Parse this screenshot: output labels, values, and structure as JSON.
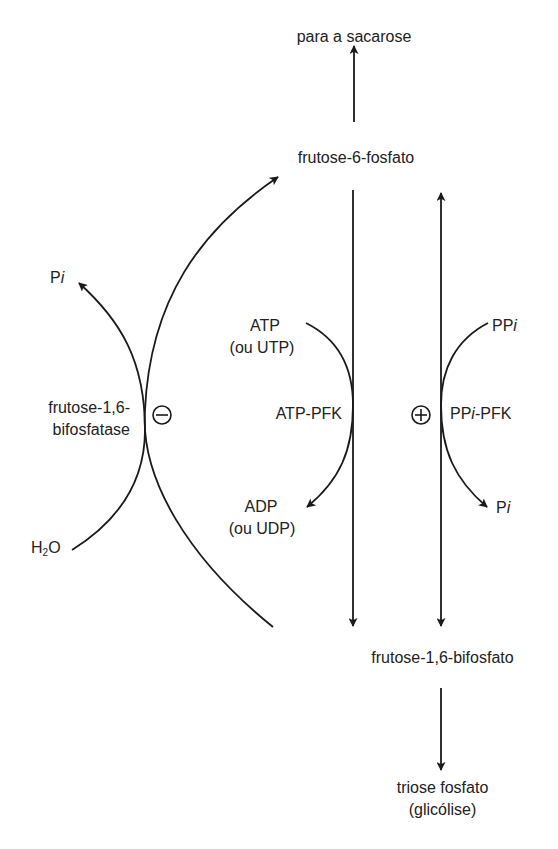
{
  "diagram": {
    "type": "metabolic-pathway",
    "nodes": {
      "sucrose_target": "para a sacarose",
      "f6p": "frutose-6-fosfato",
      "f16bp": "frutose-1,6-bifosfato",
      "triose_line1": "triose fosfato",
      "triose_line2": "(glicólise)"
    },
    "left_enzyme": {
      "name_line1": "frutose-1,6-",
      "name_line2": "bifosfatase",
      "regulation": "−",
      "regulation_symbol": "⊖",
      "substrate_in_pre": "H",
      "substrate_in_sub": "2",
      "substrate_in_post": "O",
      "product_out_pre": "P",
      "product_out_italic": "i"
    },
    "middle_enzyme": {
      "name": "ATP-PFK",
      "cofactor_in_line1": "ATP",
      "cofactor_in_line2": "(ou UTP)",
      "cofactor_out_line1": "ADP",
      "cofactor_out_line2": "(ou UDP)"
    },
    "right_enzyme": {
      "name_pre": "PP",
      "name_italic": "i",
      "name_post": "-PFK",
      "regulation": "+",
      "regulation_symbol": "⊕",
      "cofactor_in_pre": "PP",
      "cofactor_in_italic": "i",
      "cofactor_out_pre": "P",
      "cofactor_out_italic": "i"
    },
    "colors": {
      "stroke": "#1a1a1a",
      "background": "#ffffff"
    }
  }
}
